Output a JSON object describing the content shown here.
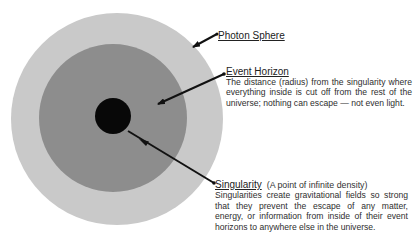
{
  "diagram": {
    "colors": {
      "photon_sphere": "#c9c9c9",
      "event_horizon": "#8d8d8d",
      "singularity": "#080808",
      "arrows": "#111111",
      "background": "#ffffff"
    },
    "regions": [
      {
        "id": "photon-sphere",
        "cx": 117,
        "cy": 119,
        "r": 106
      },
      {
        "id": "event-horizon",
        "cx": 113,
        "cy": 118,
        "r": 74
      },
      {
        "id": "singularity",
        "cx": 113,
        "cy": 116,
        "r": 18
      }
    ]
  },
  "labels": {
    "photon_sphere": {
      "title": "Photon Sphere"
    },
    "event_horizon": {
      "title": "Event Horizon",
      "description": "The distance (radius) from the singularity where everything inside is cut off from the rest of the universe; nothing can escape — not even light."
    },
    "singularity": {
      "title": "Singularity",
      "subtitle": "(A point of infinite density)",
      "description": "Singularities create gravitational fields so strong that they prevent the escape of any matter, energy, or information from inside of their event horizons to anywhere else in the universe."
    }
  }
}
